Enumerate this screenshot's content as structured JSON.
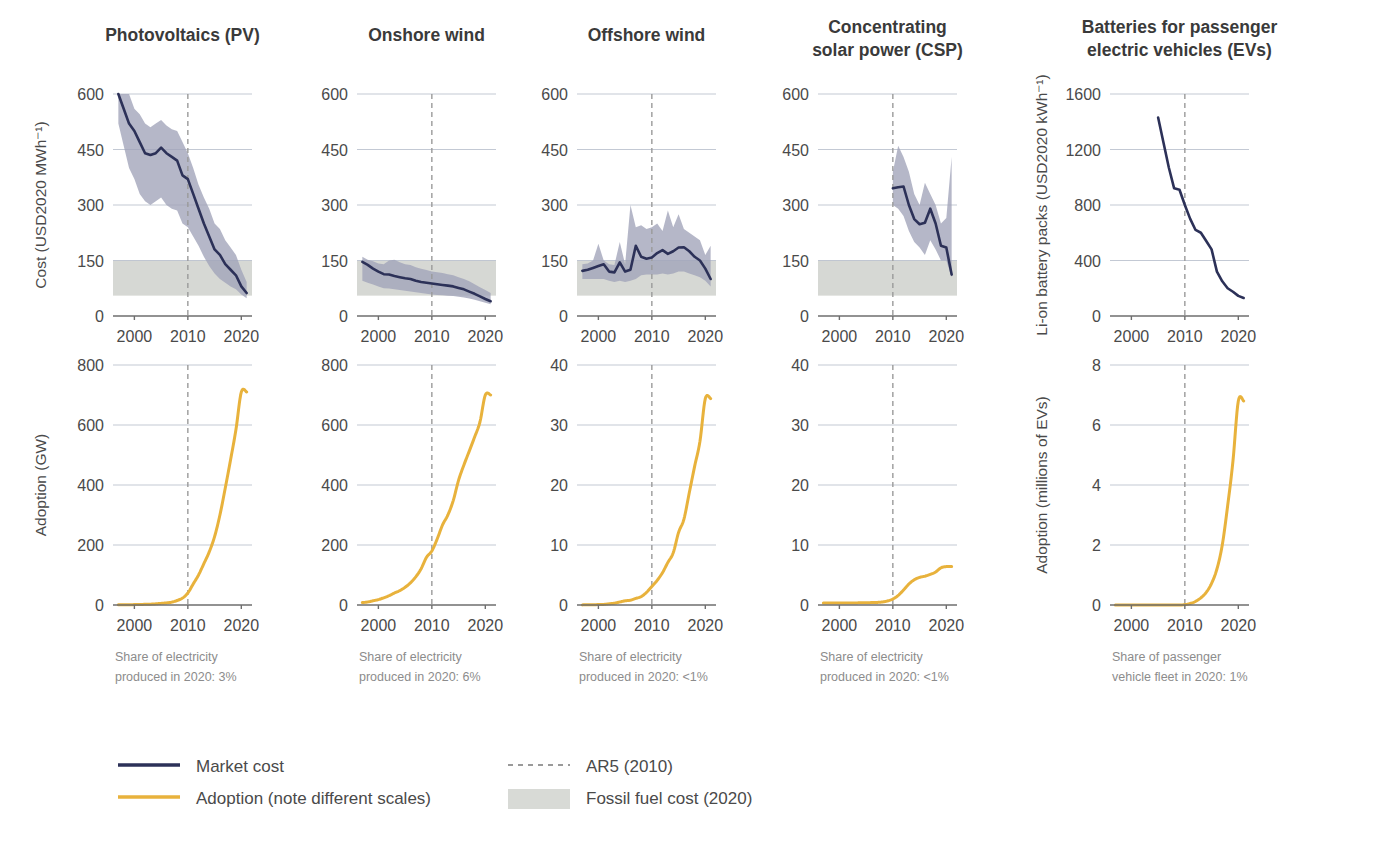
{
  "figure": {
    "background": "#ffffff",
    "line_color_cost": "#2c3158",
    "line_color_adoption": "#e8b23c",
    "band_color_uncertainty": "#a0a3b8",
    "band_color_fossil": "#d4d6d2",
    "gridline_color": "#b9c0cc",
    "ar5_line_color": "#9a9a9a",
    "axis_color": "#7a7a7a"
  },
  "axes": {
    "x_ticks": [
      "2000",
      "2010",
      "2020"
    ],
    "x_range": [
      1996,
      2022
    ],
    "ar5_year": 2010
  },
  "top_row": {
    "y_axis_label_cost": "Cost (USD2020 MWh⁻¹)",
    "y_axis_label_battery": "Li-on battery packs (USD2020 kWh⁻¹)"
  },
  "bottom_row": {
    "y_axis_label_gw": "Adoption (GW)",
    "y_axis_label_ev": "Adoption (millions of EVs)"
  },
  "panels": [
    {
      "id": "pv",
      "title": "Photovoltaics (PV)",
      "footnote_line1": "Share of electricity",
      "footnote_line2": "produced in 2020: 3%",
      "cost_yticks": [
        "0",
        "150",
        "300",
        "450",
        "600"
      ],
      "cost_ylim": [
        0,
        600
      ],
      "adoption_yticks": [
        "0",
        "200",
        "400",
        "600",
        "800"
      ],
      "adoption_ylim": [
        0,
        800
      ]
    },
    {
      "id": "onshore-wind",
      "title": "Onshore wind",
      "footnote_line1": "Share of electricity",
      "footnote_line2": "produced in 2020: 6%",
      "cost_yticks": [
        "0",
        "150",
        "300",
        "450",
        "600"
      ],
      "cost_ylim": [
        0,
        600
      ],
      "adoption_yticks": [
        "0",
        "200",
        "400",
        "600",
        "800"
      ],
      "adoption_ylim": [
        0,
        800
      ]
    },
    {
      "id": "offshore-wind",
      "title": "Offshore wind",
      "footnote_line1": "Share of electricity",
      "footnote_line2": "produced in 2020: <1%",
      "cost_yticks": [
        "0",
        "150",
        "300",
        "450",
        "600"
      ],
      "cost_ylim": [
        0,
        600
      ],
      "adoption_yticks": [
        "0",
        "10",
        "20",
        "30",
        "40"
      ],
      "adoption_ylim": [
        0,
        40
      ]
    },
    {
      "id": "csp",
      "title_line1": "Concentrating",
      "title_line2": "solar power (CSP)",
      "title": "Concentrating solar power (CSP)",
      "footnote_line1": "Share of electricity",
      "footnote_line2": "produced in 2020: <1%",
      "cost_yticks": [
        "0",
        "150",
        "300",
        "450",
        "600"
      ],
      "cost_ylim": [
        0,
        600
      ],
      "adoption_yticks": [
        "0",
        "10",
        "20",
        "30",
        "40"
      ],
      "adoption_ylim": [
        0,
        40
      ]
    },
    {
      "id": "ev-batteries",
      "title_line1": "Batteries for passenger",
      "title_line2": "electric vehicles (EVs)",
      "title": "Batteries for passenger electric vehicles (EVs)",
      "footnote_line1": "Share of passenger",
      "footnote_line2": "vehicle fleet in 2020: 1%",
      "cost_yticks": [
        "0",
        "400",
        "800",
        "1200",
        "1600"
      ],
      "cost_ylim": [
        0,
        1600
      ],
      "adoption_yticks": [
        "0",
        "2",
        "4",
        "6",
        "8"
      ],
      "adoption_ylim": [
        0,
        8
      ]
    }
  ],
  "legend": {
    "items": [
      {
        "key": "market-cost",
        "label": "Market cost",
        "style": "solid-line",
        "color": "#2c3158"
      },
      {
        "key": "adoption",
        "label": "Adoption (note different scales)",
        "style": "solid-line",
        "color": "#e8b23c"
      },
      {
        "key": "ar5",
        "label": "AR5 (2010)",
        "style": "dashed-line",
        "color": "#9a9a9a"
      },
      {
        "key": "fossil-fuel",
        "label": "Fossil fuel cost (2020)",
        "style": "swatch",
        "color": "#d4d6d2"
      }
    ]
  },
  "chart_data": {
    "type": "line",
    "xlabel": "Year",
    "grid": true,
    "legend_position": "bottom-left",
    "panels": [
      {
        "name": "Photovoltaics (PV)",
        "cost": {
          "ylabel": "Cost (USD2020 MWh⁻¹)",
          "ylim": [
            0,
            600
          ],
          "xlim": [
            1996,
            2022
          ],
          "fossil_band": [
            55,
            150
          ],
          "x": [
            1997,
            1998,
            1999,
            2000,
            2001,
            2002,
            2003,
            2004,
            2005,
            2006,
            2007,
            2008,
            2009,
            2010,
            2011,
            2012,
            2013,
            2014,
            2015,
            2016,
            2017,
            2018,
            2019,
            2020,
            2021
          ],
          "market_cost": [
            600,
            560,
            520,
            500,
            470,
            440,
            435,
            440,
            455,
            440,
            430,
            420,
            380,
            370,
            330,
            290,
            250,
            215,
            180,
            165,
            140,
            125,
            110,
            80,
            62
          ],
          "band_low": [
            520,
            460,
            400,
            370,
            330,
            310,
            300,
            310,
            320,
            300,
            290,
            285,
            250,
            240,
            215,
            190,
            160,
            135,
            115,
            100,
            90,
            80,
            72,
            58,
            48
          ],
          "band_high": [
            600,
            600,
            600,
            560,
            545,
            520,
            510,
            520,
            530,
            515,
            505,
            500,
            470,
            440,
            400,
            355,
            320,
            290,
            250,
            235,
            205,
            185,
            165,
            125,
            92
          ]
        },
        "adoption": {
          "ylabel": "Adoption (GW)",
          "ylim": [
            0,
            800
          ],
          "x": [
            1997,
            1998,
            1999,
            2000,
            2001,
            2002,
            2003,
            2004,
            2005,
            2006,
            2007,
            2008,
            2009,
            2010,
            2011,
            2012,
            2013,
            2014,
            2015,
            2016,
            2017,
            2018,
            2019,
            2020,
            2021
          ],
          "values": [
            0.5,
            0.8,
            1,
            1.3,
            1.8,
            2.2,
            2.8,
            3.9,
            5.4,
            7,
            9.5,
            15,
            23,
            40,
            70,
            100,
            138,
            177,
            228,
            300,
            390,
            485,
            585,
            710,
            710
          ]
        }
      },
      {
        "name": "Onshore wind",
        "cost": {
          "ylabel": "Cost (USD2020 MWh⁻¹)",
          "ylim": [
            0,
            600
          ],
          "xlim": [
            1996,
            2022
          ],
          "fossil_band": [
            55,
            150
          ],
          "x": [
            1997,
            1998,
            1999,
            2000,
            2001,
            2002,
            2003,
            2004,
            2005,
            2006,
            2007,
            2008,
            2009,
            2010,
            2011,
            2012,
            2013,
            2014,
            2015,
            2016,
            2017,
            2018,
            2019,
            2020,
            2021
          ],
          "market_cost": [
            146,
            138,
            128,
            120,
            113,
            112,
            108,
            105,
            102,
            100,
            95,
            92,
            90,
            88,
            86,
            84,
            82,
            80,
            76,
            72,
            66,
            60,
            53,
            46,
            40
          ],
          "band_low": [
            95,
            90,
            85,
            80,
            75,
            74,
            72,
            70,
            68,
            66,
            64,
            62,
            60,
            58,
            57,
            56,
            55,
            54,
            52,
            50,
            47,
            44,
            40,
            36,
            32
          ],
          "band_high": [
            160,
            152,
            148,
            142,
            140,
            150,
            152,
            145,
            140,
            138,
            132,
            128,
            124,
            120,
            118,
            116,
            113,
            110,
            105,
            100,
            94,
            86,
            78,
            70,
            62
          ]
        },
        "adoption": {
          "ylabel": "Adoption (GW)",
          "ylim": [
            0,
            800
          ],
          "x": [
            1997,
            1998,
            1999,
            2000,
            2001,
            2002,
            2003,
            2004,
            2005,
            2006,
            2007,
            2008,
            2009,
            2010,
            2011,
            2012,
            2013,
            2014,
            2015,
            2016,
            2017,
            2018,
            2019,
            2020,
            2021
          ],
          "values": [
            8,
            10,
            14,
            18,
            24,
            31,
            40,
            48,
            59,
            74,
            94,
            121,
            159,
            180,
            220,
            267,
            300,
            348,
            416,
            467,
            513,
            560,
            610,
            700,
            700
          ]
        }
      },
      {
        "name": "Offshore wind",
        "cost": {
          "ylabel": "Cost (USD2020 MWh⁻¹)",
          "ylim": [
            0,
            600
          ],
          "xlim": [
            1996,
            2022
          ],
          "fossil_band": [
            55,
            150
          ],
          "x": [
            1997,
            1998,
            1999,
            2000,
            2001,
            2002,
            2003,
            2004,
            2005,
            2006,
            2007,
            2008,
            2009,
            2010,
            2011,
            2012,
            2013,
            2014,
            2015,
            2016,
            2017,
            2018,
            2019,
            2020,
            2021
          ],
          "market_cost": [
            122,
            125,
            130,
            135,
            140,
            120,
            118,
            145,
            120,
            125,
            190,
            160,
            155,
            158,
            170,
            178,
            168,
            175,
            185,
            186,
            175,
            160,
            150,
            128,
            100
          ],
          "band_low": [
            100,
            100,
            100,
            100,
            100,
            95,
            92,
            95,
            92,
            95,
            100,
            110,
            112,
            112,
            112,
            115,
            112,
            115,
            120,
            120,
            115,
            110,
            105,
            95,
            80
          ],
          "band_high": [
            140,
            142,
            150,
            195,
            150,
            140,
            138,
            200,
            140,
            300,
            240,
            245,
            235,
            240,
            250,
            230,
            285,
            240,
            275,
            235,
            225,
            215,
            205,
            165,
            190
          ]
        },
        "adoption": {
          "ylabel": "Adoption (GW)",
          "ylim": [
            0,
            40
          ],
          "x": [
            1997,
            1998,
            1999,
            2000,
            2001,
            2002,
            2003,
            2004,
            2005,
            2006,
            2007,
            2008,
            2009,
            2010,
            2011,
            2012,
            2013,
            2014,
            2015,
            2016,
            2017,
            2018,
            2019,
            2020,
            2021
          ],
          "values": [
            0.02,
            0.03,
            0.03,
            0.08,
            0.1,
            0.2,
            0.3,
            0.5,
            0.7,
            0.8,
            1.1,
            1.4,
            2.1,
            3.1,
            4.1,
            5.4,
            7.1,
            8.7,
            12.1,
            14.3,
            18.7,
            23.1,
            27.3,
            34.4,
            34.4
          ]
        }
      },
      {
        "name": "Concentrating solar power (CSP)",
        "cost": {
          "ylabel": "Cost (USD2020 MWh⁻¹)",
          "ylim": [
            0,
            600
          ],
          "xlim": [
            1996,
            2022
          ],
          "fossil_band": [
            55,
            150
          ],
          "x": [
            2010,
            2011,
            2012,
            2013,
            2014,
            2015,
            2016,
            2017,
            2018,
            2019,
            2020,
            2021
          ],
          "market_cost": [
            345,
            348,
            350,
            300,
            262,
            248,
            252,
            290,
            250,
            190,
            185,
            112
          ],
          "band_low": [
            300,
            290,
            270,
            230,
            200,
            185,
            165,
            205,
            180,
            150,
            150,
            105
          ],
          "band_high": [
            390,
            460,
            430,
            390,
            330,
            300,
            360,
            330,
            300,
            250,
            265,
            430
          ]
        },
        "adoption": {
          "ylabel": "Adoption (GW)",
          "ylim": [
            0,
            40
          ],
          "x": [
            1997,
            1998,
            1999,
            2000,
            2001,
            2002,
            2003,
            2004,
            2005,
            2006,
            2007,
            2008,
            2009,
            2010,
            2011,
            2012,
            2013,
            2014,
            2015,
            2016,
            2017,
            2018,
            2019,
            2020,
            2021
          ],
          "values": [
            0.35,
            0.35,
            0.35,
            0.35,
            0.35,
            0.35,
            0.35,
            0.36,
            0.37,
            0.4,
            0.43,
            0.5,
            0.67,
            1.0,
            1.6,
            2.5,
            3.5,
            4.2,
            4.6,
            4.8,
            5.1,
            5.5,
            6.2,
            6.4,
            6.4
          ]
        }
      },
      {
        "name": "Batteries for passenger electric vehicles (EVs)",
        "cost": {
          "ylabel": "Li-on battery packs (USD2020 kWh⁻¹)",
          "ylim": [
            0,
            1600
          ],
          "xlim": [
            1996,
            2022
          ],
          "x": [
            2005,
            2006,
            2007,
            2008,
            2009,
            2010,
            2011,
            2012,
            2013,
            2014,
            2015,
            2016,
            2017,
            2018,
            2019,
            2020,
            2021
          ],
          "market_cost": [
            1430,
            1250,
            1070,
            920,
            910,
            800,
            700,
            620,
            600,
            540,
            480,
            320,
            250,
            200,
            175,
            145,
            130
          ]
        },
        "adoption": {
          "ylabel": "Adoption (millions of EVs)",
          "ylim": [
            0,
            8
          ],
          "x": [
            1997,
            1998,
            1999,
            2000,
            2001,
            2002,
            2003,
            2004,
            2005,
            2006,
            2007,
            2008,
            2009,
            2010,
            2011,
            2012,
            2013,
            2014,
            2015,
            2016,
            2017,
            2018,
            2019,
            2020,
            2021
          ],
          "values": [
            0,
            0,
            0,
            0,
            0,
            0,
            0,
            0,
            0,
            0,
            0,
            0,
            0.002,
            0.01,
            0.05,
            0.12,
            0.24,
            0.42,
            0.72,
            1.2,
            2.0,
            3.3,
            4.8,
            6.8,
            6.8
          ]
        }
      }
    ]
  }
}
